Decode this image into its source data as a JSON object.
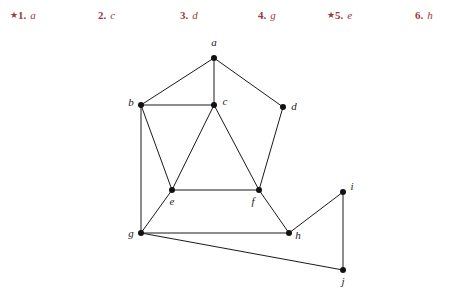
{
  "exercises": {
    "items": [
      {
        "star": "★",
        "number": "1.",
        "answer": "a",
        "x": 10
      },
      {
        "star": "",
        "number": "2.",
        "answer": "c",
        "x": 98
      },
      {
        "star": "",
        "number": "3.",
        "answer": "d",
        "x": 180
      },
      {
        "star": "",
        "number": "4.",
        "answer": "g",
        "x": 258
      },
      {
        "star": "★",
        "number": "5.",
        "answer": "e",
        "x": 327
      },
      {
        "star": "",
        "number": "6.",
        "answer": "h",
        "x": 415
      }
    ],
    "accent_color": "#9c3a3c",
    "star_glyph": "★"
  },
  "graph": {
    "stroke_color": "#1a1a1a",
    "vertex_color": "#111111",
    "vertex_radius": 3,
    "edge_width": 1,
    "vertices": [
      {
        "id": "a",
        "label": "a",
        "x": 214,
        "y": 28,
        "lx": 214,
        "ly": 16
      },
      {
        "id": "b",
        "label": "b",
        "x": 141,
        "y": 75,
        "lx": 131,
        "ly": 76
      },
      {
        "id": "c",
        "label": "c",
        "x": 214,
        "y": 75,
        "lx": 225,
        "ly": 75
      },
      {
        "id": "d",
        "label": "d",
        "x": 283,
        "y": 77,
        "lx": 294,
        "ly": 80
      },
      {
        "id": "e",
        "label": "e",
        "x": 172,
        "y": 160,
        "lx": 172,
        "ly": 175
      },
      {
        "id": "f",
        "label": "f",
        "x": 259,
        "y": 160,
        "lx": 253,
        "ly": 175
      },
      {
        "id": "g",
        "label": "g",
        "x": 141,
        "y": 203,
        "lx": 131,
        "ly": 207
      },
      {
        "id": "h",
        "label": "h",
        "x": 289,
        "y": 203,
        "lx": 298,
        "ly": 209
      },
      {
        "id": "i",
        "label": "i",
        "x": 343,
        "y": 162,
        "lx": 352,
        "ly": 160
      },
      {
        "id": "j",
        "label": "j",
        "x": 343,
        "y": 240,
        "lx": 343,
        "ly": 255
      }
    ],
    "edges": [
      [
        "a",
        "b"
      ],
      [
        "a",
        "c"
      ],
      [
        "a",
        "d"
      ],
      [
        "b",
        "c"
      ],
      [
        "b",
        "e"
      ],
      [
        "b",
        "g"
      ],
      [
        "c",
        "e"
      ],
      [
        "c",
        "f"
      ],
      [
        "d",
        "f"
      ],
      [
        "e",
        "f"
      ],
      [
        "e",
        "g"
      ],
      [
        "f",
        "h"
      ],
      [
        "g",
        "h"
      ],
      [
        "g",
        "j"
      ],
      [
        "h",
        "i"
      ],
      [
        "i",
        "j"
      ]
    ]
  }
}
